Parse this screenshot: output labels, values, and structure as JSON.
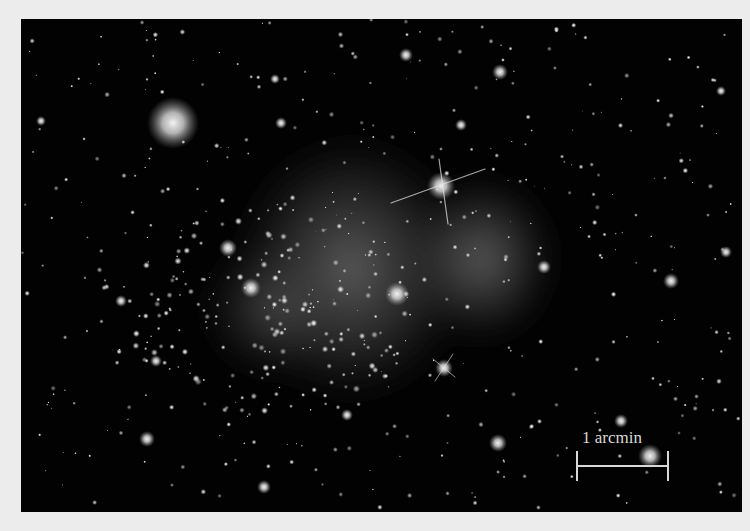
{
  "figure": {
    "background_color": "#ececec",
    "image_background": "#020202",
    "scale_bar": {
      "label": "1 arcmin",
      "color": "#d8d8d8"
    }
  }
}
